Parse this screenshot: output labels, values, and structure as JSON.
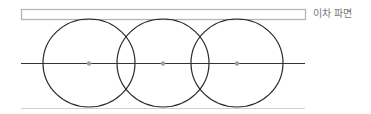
{
  "legend": {
    "label": "이차 파면",
    "box": {
      "x": 21,
      "y": 9,
      "width": 284,
      "height": 10,
      "stroke": "#b4b4b4"
    }
  },
  "axis_line": {
    "x1": 21,
    "x2": 305,
    "y": 63,
    "stroke": "#333333"
  },
  "baseline": {
    "x1": 21,
    "x2": 305,
    "y": 108,
    "stroke": "#d0d0d0"
  },
  "wavelets": [
    {
      "cx": 89,
      "cy": 63,
      "rx": 46,
      "ry": 44
    },
    {
      "cx": 163,
      "cy": 63,
      "rx": 46,
      "ry": 44
    },
    {
      "cx": 237,
      "cy": 63,
      "rx": 46,
      "ry": 44
    }
  ],
  "colors": {
    "circle": "#2a2a2a",
    "source_dot": "#a0a0a0",
    "text": "#777777"
  }
}
